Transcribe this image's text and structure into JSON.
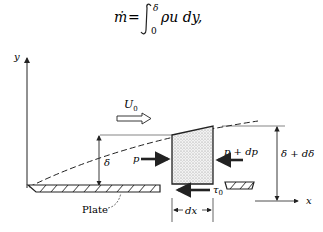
{
  "equation": {
    "lhs": "ṁ",
    "equals": "=",
    "integral_upper": "δ",
    "integral_lower": "0",
    "integrand": "ρu dy,"
  },
  "diagram": {
    "axes": {
      "y_label": "y",
      "x_label": "x"
    },
    "free_stream": {
      "label": "U",
      "subscript": "0"
    },
    "boundary_layer": {
      "thickness_left": "δ",
      "thickness_right": "δ + dδ"
    },
    "forces": {
      "pressure_left": "p",
      "pressure_right": "p + dp",
      "shear": "τ",
      "shear_subscript": "0"
    },
    "control_volume_width": "dx",
    "plate_label": "Plate",
    "colors": {
      "ink": "#222222",
      "stipple": "#cfcfcf"
    }
  }
}
